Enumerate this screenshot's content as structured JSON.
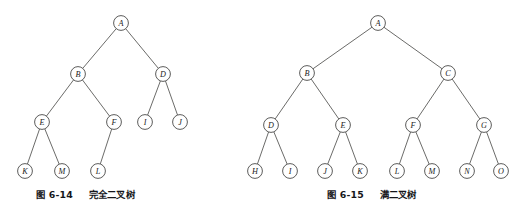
{
  "figures": [
    {
      "id": "figure-6-14",
      "caption_number": "图 6-14",
      "caption_title": "完全二叉树",
      "caption_full": "图 6-14  完全二叉树",
      "tree_type": "complete-binary-tree",
      "node_radius": 7.4,
      "nodes": [
        {
          "label": "A",
          "x": 121,
          "y": 23
        },
        {
          "label": "B",
          "x": 78,
          "y": 74
        },
        {
          "label": "D",
          "x": 163,
          "y": 74
        },
        {
          "label": "E",
          "x": 42,
          "y": 122
        },
        {
          "label": "F",
          "x": 114,
          "y": 122
        },
        {
          "label": "I",
          "x": 145,
          "y": 122
        },
        {
          "label": "J",
          "x": 180,
          "y": 122
        },
        {
          "label": "K",
          "x": 25,
          "y": 171
        },
        {
          "label": "M",
          "x": 62,
          "y": 171
        },
        {
          "label": "L",
          "x": 98,
          "y": 171
        }
      ],
      "edges": [
        {
          "from": "A",
          "to": "B"
        },
        {
          "from": "A",
          "to": "D"
        },
        {
          "from": "B",
          "to": "E"
        },
        {
          "from": "B",
          "to": "F"
        },
        {
          "from": "D",
          "to": "I"
        },
        {
          "from": "D",
          "to": "J"
        },
        {
          "from": "E",
          "to": "K"
        },
        {
          "from": "E",
          "to": "M"
        },
        {
          "from": "F",
          "to": "L"
        }
      ]
    },
    {
      "id": "figure-6-15",
      "caption_number": "图 6-15",
      "caption_title": "满二叉树",
      "caption_full": "图 6-15  满二叉树",
      "tree_type": "full-binary-tree",
      "node_radius": 7.4,
      "nodes": [
        {
          "label": "A",
          "x": 378,
          "y": 23
        },
        {
          "label": "B",
          "x": 307,
          "y": 73
        },
        {
          "label": "C",
          "x": 448,
          "y": 73
        },
        {
          "label": "D",
          "x": 271,
          "y": 125
        },
        {
          "label": "E",
          "x": 343,
          "y": 125
        },
        {
          "label": "F",
          "x": 413,
          "y": 125
        },
        {
          "label": "G",
          "x": 484,
          "y": 125
        },
        {
          "label": "H",
          "x": 255,
          "y": 171
        },
        {
          "label": "I",
          "x": 290,
          "y": 171
        },
        {
          "label": "J",
          "x": 325,
          "y": 171
        },
        {
          "label": "K",
          "x": 360,
          "y": 171
        },
        {
          "label": "L",
          "x": 397,
          "y": 171
        },
        {
          "label": "M",
          "x": 432,
          "y": 171
        },
        {
          "label": "N",
          "x": 467,
          "y": 171
        },
        {
          "label": "O",
          "x": 501,
          "y": 171
        }
      ],
      "edges": [
        {
          "from": "A",
          "to": "B"
        },
        {
          "from": "A",
          "to": "C"
        },
        {
          "from": "B",
          "to": "D"
        },
        {
          "from": "B",
          "to": "E"
        },
        {
          "from": "C",
          "to": "F"
        },
        {
          "from": "C",
          "to": "G"
        },
        {
          "from": "D",
          "to": "H"
        },
        {
          "from": "D",
          "to": "I"
        },
        {
          "from": "E",
          "to": "J"
        },
        {
          "from": "E",
          "to": "K"
        },
        {
          "from": "F",
          "to": "L"
        },
        {
          "from": "F",
          "to": "M"
        },
        {
          "from": "G",
          "to": "N"
        },
        {
          "from": "G",
          "to": "O"
        }
      ]
    }
  ],
  "colors": {
    "background": "#ffffff",
    "edge_stroke": "#5a5a58",
    "node_stroke": "#4a4a48",
    "node_fill": "#ffffff",
    "label_text": "#1c1c1c",
    "caption_text": "#16161a"
  }
}
